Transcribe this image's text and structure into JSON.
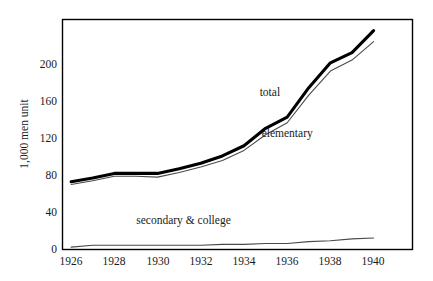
{
  "chart_data": {
    "type": "line",
    "title": "",
    "xlabel": "",
    "ylabel": "1,000 men unit",
    "x": [
      1926,
      1927,
      1928,
      1929,
      1930,
      1931,
      1932,
      1933,
      1934,
      1935,
      1936,
      1937,
      1938,
      1939,
      1940
    ],
    "xlim": [
      1925.6,
      1941.8
    ],
    "ylim": [
      0,
      249
    ],
    "xticks": [
      1926,
      1928,
      1930,
      1932,
      1934,
      1936,
      1938,
      1940
    ],
    "xtick_labels": [
      "1926",
      "1928",
      "1930",
      "1932",
      "1934",
      "1936",
      "1938",
      "1940"
    ],
    "yticks": [
      0,
      40,
      80,
      120,
      160,
      200
    ],
    "ytick_labels": [
      "0",
      "40",
      "80",
      "120",
      "160",
      "200"
    ],
    "grid": false,
    "legend_position": "inline-annotations",
    "series": [
      {
        "name": "total",
        "label": "total",
        "color": "#000000",
        "values": [
          73,
          77,
          82,
          82,
          82,
          87,
          93,
          101,
          112,
          131,
          143,
          175,
          202,
          213,
          237
        ]
      },
      {
        "name": "elementary",
        "label": "elementary",
        "color": "#4a4a4a",
        "values": [
          70,
          74,
          79,
          79,
          78,
          83,
          89,
          96,
          107,
          124,
          137,
          167,
          193,
          205,
          225
        ]
      },
      {
        "name": "secondary & college",
        "label": "secondary & college",
        "color": "#4a4a4a",
        "values": [
          2,
          4,
          4,
          4,
          4,
          4,
          4,
          5,
          5,
          6,
          6,
          8,
          9,
          11,
          12
        ]
      }
    ],
    "annotations": [
      {
        "text": "total",
        "x": 1935.2,
        "y": 166
      },
      {
        "text": "elementary",
        "x": 1936.0,
        "y": 121
      },
      {
        "text": "secondary & college",
        "x": 1931.2,
        "y": 27
      }
    ]
  }
}
